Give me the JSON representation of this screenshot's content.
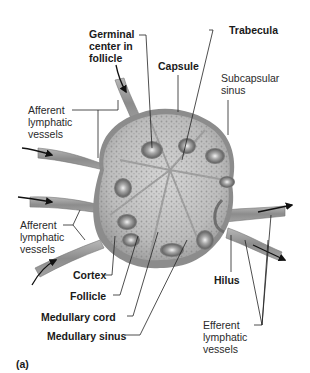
{
  "figure": {
    "panel_label": "(a)"
  },
  "labels": {
    "germinal_center": "Germinal\ncenter in\nfollicle",
    "capsule": "Capsule",
    "trabecula": "Trabecula",
    "subcapsular_sinus": "Subcapsular\nsinus",
    "afferent_upper": "Afferent\nlymphatic\nvessels",
    "afferent_lower": "Afferent\nlymphatic\nvessels",
    "cortex": "Cortex",
    "follicle": "Follicle",
    "medullary_cord": "Medullary cord",
    "medullary_sinus": "Medullary sinus",
    "hilus": "Hilus",
    "efferent": "Efferent\nlymphatic\nvessels"
  },
  "colors": {
    "tissue_light": "#c9c9c9",
    "tissue_mid": "#9a9a9a",
    "tissue_dark": "#6e6e6e",
    "capsule": "#858585",
    "line": "#222222"
  }
}
